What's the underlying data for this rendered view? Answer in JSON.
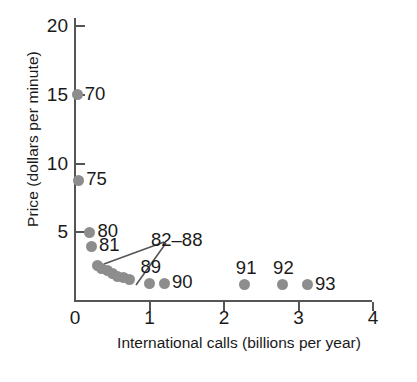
{
  "chart_data": {
    "type": "scatter",
    "title": "",
    "xlabel": "International calls (billions per year)",
    "ylabel": "Price (dollars per minute)",
    "xlim": [
      0,
      4.25
    ],
    "ylim": [
      0,
      21.3
    ],
    "xticks": [
      0,
      1,
      2,
      3,
      4
    ],
    "xtick_labels": [
      "0",
      "1",
      "2",
      "3",
      "4"
    ],
    "yticks": [
      5,
      10,
      15,
      20
    ],
    "ytick_labels": [
      "5",
      "10",
      "15",
      "20"
    ],
    "grid": false,
    "legend": null,
    "marker": {
      "shape": "circle",
      "color": "#8d8d8d",
      "size": 11
    },
    "points": [
      {
        "label": "70",
        "x": 0.03,
        "y": 15.0,
        "label_pos": "right"
      },
      {
        "label": "75",
        "x": 0.05,
        "y": 8.8,
        "label_pos": "right"
      },
      {
        "label": "80",
        "x": 0.2,
        "y": 5.0,
        "label_pos": "right"
      },
      {
        "label": "81",
        "x": 0.22,
        "y": 4.0,
        "label_pos": "right"
      },
      {
        "label": "82",
        "x": 0.3,
        "y": 2.6,
        "label_pos": "none"
      },
      {
        "label": "83",
        "x": 0.36,
        "y": 2.4,
        "label_pos": "none"
      },
      {
        "label": "84",
        "x": 0.43,
        "y": 2.2,
        "label_pos": "none"
      },
      {
        "label": "85",
        "x": 0.5,
        "y": 2.0,
        "label_pos": "none"
      },
      {
        "label": "86",
        "x": 0.57,
        "y": 1.8,
        "label_pos": "none"
      },
      {
        "label": "87",
        "x": 0.65,
        "y": 1.7,
        "label_pos": "none"
      },
      {
        "label": "88",
        "x": 0.73,
        "y": 1.6,
        "label_pos": "none"
      },
      {
        "label": "89",
        "x": 1.0,
        "y": 1.3,
        "label_pos": "above"
      },
      {
        "label": "90",
        "x": 1.2,
        "y": 1.3,
        "label_pos": "right"
      },
      {
        "label": "91",
        "x": 2.28,
        "y": 1.2,
        "label_pos": "above"
      },
      {
        "label": "92",
        "x": 2.78,
        "y": 1.2,
        "label_pos": "above"
      },
      {
        "label": "93",
        "x": 3.12,
        "y": 1.2,
        "label_pos": "right"
      }
    ],
    "annotations": [
      {
        "text": "82–88",
        "x": 1.02,
        "y": 4.45,
        "targets": [
          "cluster-chain",
          "point-89"
        ]
      }
    ]
  }
}
